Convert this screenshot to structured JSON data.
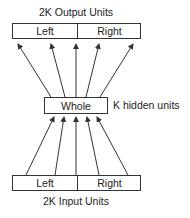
{
  "diagram": {
    "output_layer": {
      "title": "2K Output Units",
      "left_label": "Left",
      "right_label": "Right"
    },
    "hidden_layer": {
      "label": "Whole",
      "side_label": "K hidden units"
    },
    "input_layer": {
      "title": "2K Input Units",
      "left_label": "Left",
      "right_label": "Right"
    },
    "edges": {
      "hidden_to_output": [
        {
          "from": [
            51,
            97
          ],
          "to": [
            18,
            44
          ]
        },
        {
          "from": [
            65,
            97
          ],
          "to": [
            51,
            44
          ]
        },
        {
          "from": [
            76,
            97
          ],
          "to": [
            76,
            44
          ]
        },
        {
          "from": [
            86,
            97
          ],
          "to": [
            99,
            44
          ]
        },
        {
          "from": [
            100,
            97
          ],
          "to": [
            133,
            44
          ]
        }
      ],
      "input_to_hidden": [
        {
          "from": [
            26,
            175
          ],
          "to": [
            54,
            117
          ]
        },
        {
          "from": [
            55,
            175
          ],
          "to": [
            64,
            117
          ]
        },
        {
          "from": [
            76,
            175
          ],
          "to": [
            76,
            117
          ]
        },
        {
          "from": [
            99,
            175
          ],
          "to": [
            87,
            117
          ]
        },
        {
          "from": [
            128,
            175
          ],
          "to": [
            97,
            117
          ]
        }
      ]
    },
    "colors": {
      "stroke": "#333333",
      "background": "#ffffff"
    }
  }
}
